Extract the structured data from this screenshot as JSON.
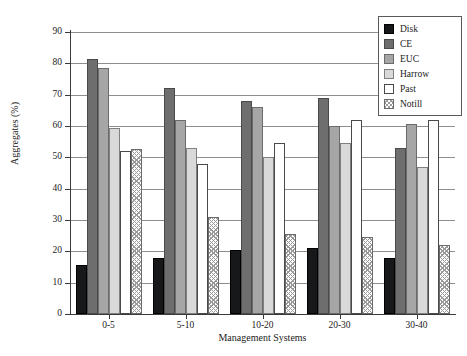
{
  "chart_data": {
    "type": "bar",
    "title": "",
    "xlabel": "Management Systems",
    "ylabel": "Aggregates (%)",
    "ylim": [
      0,
      90
    ],
    "ytick_step": 10,
    "yticks": [
      0,
      10,
      20,
      30,
      40,
      50,
      60,
      70,
      80,
      90
    ],
    "grid": true,
    "grid_axis": "y",
    "legend_position": "top-right",
    "categories": [
      "0-5",
      "5-10",
      "10-20",
      "20-30",
      "30-40"
    ],
    "series": [
      {
        "name": "Disk",
        "color": "#17181a",
        "fill": "solid",
        "values": [
          15.5,
          18.0,
          20.5,
          21.0,
          18.0
        ]
      },
      {
        "name": "CE",
        "color": "#6e6e6e",
        "fill": "solid",
        "values": [
          81.5,
          72.0,
          68.0,
          69.0,
          53.0
        ]
      },
      {
        "name": "EUC",
        "color": "#a6a6a6",
        "fill": "solid",
        "values": [
          78.5,
          62.0,
          66.0,
          60.0,
          60.5
        ]
      },
      {
        "name": "Harrow",
        "color": "#d9d9d9",
        "fill": "solid",
        "values": [
          59.5,
          53.0,
          50.0,
          54.5,
          47.0
        ]
      },
      {
        "name": "Past",
        "color": "#ffffff",
        "fill": "empty",
        "values": [
          52.0,
          48.0,
          54.5,
          62.0,
          62.0
        ]
      },
      {
        "name": "Notill",
        "color": "#ffffff",
        "fill": "crosshatch",
        "values": [
          52.5,
          31.0,
          25.5,
          24.5,
          22.0
        ]
      }
    ]
  },
  "axes": {
    "y_title": "Aggregates (%)",
    "x_title": "Management Systems",
    "y_tick_labels": [
      "0",
      "10",
      "20",
      "30",
      "40",
      "50",
      "60",
      "70",
      "80",
      "90"
    ],
    "x_tick_labels": [
      "0-5",
      "5-10",
      "10-20",
      "20-30",
      "30-40"
    ]
  },
  "legend": {
    "items": [
      {
        "label": "Disk"
      },
      {
        "label": "CE"
      },
      {
        "label": "EUC"
      },
      {
        "label": "Harrow"
      },
      {
        "label": "Past"
      },
      {
        "label": "Notill"
      }
    ]
  }
}
